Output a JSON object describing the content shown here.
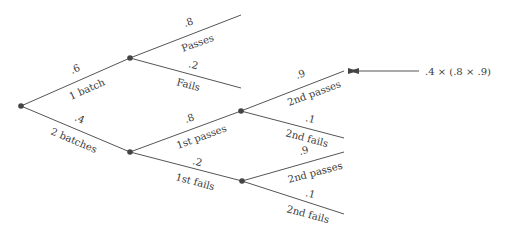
{
  "diagram": {
    "type": "probability-tree",
    "nodes": [
      {
        "id": "root",
        "x": 21,
        "y": 106
      },
      {
        "id": "one_batch",
        "x": 130,
        "y": 58
      },
      {
        "id": "two_batches",
        "x": 130,
        "y": 152
      },
      {
        "id": "first_passes",
        "x": 241,
        "y": 111
      },
      {
        "id": "first_fails",
        "x": 242,
        "y": 181
      }
    ],
    "edges": [
      {
        "from": "root",
        "to": "one_batch",
        "prob": ".6",
        "label": "1 batch"
      },
      {
        "from": "root",
        "to": "two_batches",
        "prob": ".4",
        "label": "2 batches"
      },
      {
        "from": "one_batch",
        "to": "leaf_passes",
        "prob": ".8",
        "label": "Passes"
      },
      {
        "from": "one_batch",
        "to": "leaf_fails",
        "prob": ".2",
        "label": "Fails"
      },
      {
        "from": "two_batches",
        "to": "first_passes",
        "prob": ".8",
        "label": "1st passes"
      },
      {
        "from": "two_batches",
        "to": "first_fails",
        "prob": ".2",
        "label": "1st fails"
      },
      {
        "from": "first_passes",
        "to": "leaf_2p_a",
        "prob": ".9",
        "label": "2nd passes"
      },
      {
        "from": "first_passes",
        "to": "leaf_2f_a",
        "prob": ".1",
        "label": "2nd fails"
      },
      {
        "from": "first_fails",
        "to": "leaf_2p_b",
        "prob": ".9",
        "label": "2nd passes"
      },
      {
        "from": "first_fails",
        "to": "leaf_2f_b",
        "prob": ".1",
        "label": "2nd fails"
      }
    ],
    "annotation": {
      "text": ".4 × (.8 × .9)",
      "points_to": "leaf_2p_a"
    }
  }
}
